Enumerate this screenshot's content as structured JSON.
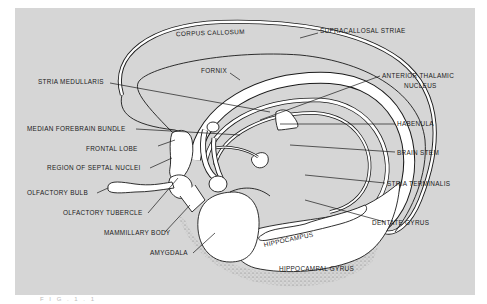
{
  "figure": {
    "caption_fragment": "F  I  G  .     1  .  1"
  },
  "labels": {
    "corpus_callosum": "CORPUS CALLOSUM",
    "supracallosal_striae": "SUPRACALLOSAL STRIAE",
    "fornix": "FORNIX",
    "stria_medullaris": "STRIA MEDULLARIS",
    "anterior_thalamic_1": "ANTERIOR THALAMIC",
    "anterior_thalamic_2": "NUCLEUS",
    "median_forebrain_bundle": "MEDIAN FOREBRAIN BUNDLE",
    "habenula": "HABENULA",
    "frontal_lobe": "FRONTAL LOBE",
    "brain_stem": "BRAIN STEM",
    "region_septal_nuclei": "REGION OF SEPTAL NUCLEI",
    "olfactory_bulb": "OLFACTORY BULB",
    "stria_terminalis": "STRIA TERMINALIS",
    "olfactory_tubercle": "OLFACTORY TUBERCLE",
    "mammillary_body": "MAMMILLARY BODY",
    "dentate_gyrus": "DENTATE GYRUS",
    "amygdala": "AMYGDALA",
    "hippocampus": "HIPPOCAMPUS",
    "hippocampal_gyrus": "HIPPOCAMPAL GYRUS"
  },
  "colors": {
    "background": "#d6d6d6",
    "structure_fill": "#ffffff",
    "outline": "#1a1a1a"
  }
}
